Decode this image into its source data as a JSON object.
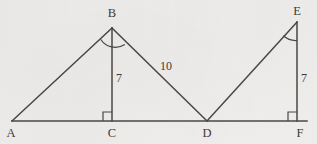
{
  "figure": {
    "kind": "geometry-diagram",
    "canvas": {
      "width": 317,
      "height": 144
    },
    "background_color": "#f1efed",
    "stroke_color": "#4a4745",
    "text_color": "#3f3c3a",
    "stroke_width": 1.5
  },
  "vertices": [
    {
      "id": "A",
      "label": "A",
      "x": 12,
      "y": 121,
      "label_x": 11,
      "label_y": 133
    },
    {
      "id": "B",
      "label": "B",
      "x": 112,
      "y": 28,
      "label_x": 112,
      "label_y": 13
    },
    {
      "id": "C",
      "label": "C",
      "x": 112,
      "y": 121,
      "label_x": 112,
      "label_y": 133
    },
    {
      "id": "D",
      "label": "D",
      "x": 207,
      "y": 121,
      "label_x": 207,
      "label_y": 133
    },
    {
      "id": "E",
      "label": "E",
      "x": 297,
      "y": 22,
      "label_x": 297,
      "label_y": 11
    },
    {
      "id": "F",
      "label": "F",
      "x": 297,
      "y": 121,
      "label_x": 300,
      "label_y": 133
    }
  ],
  "segments": [
    {
      "name": "baseline-A-F",
      "from": "A",
      "to": "F",
      "x1": 12,
      "y1": 121,
      "x2": 307,
      "y2": 121
    },
    {
      "name": "side-A-B",
      "from": "A",
      "to": "B",
      "x1": 12,
      "y1": 121,
      "x2": 112,
      "y2": 28
    },
    {
      "name": "altitude-B-C",
      "from": "B",
      "to": "C",
      "x1": 112,
      "y1": 28,
      "x2": 112,
      "y2": 121
    },
    {
      "name": "hypotenuse-B-D",
      "from": "B",
      "to": "D",
      "x1": 112,
      "y1": 28,
      "x2": 207,
      "y2": 121
    },
    {
      "name": "hypotenuse-D-E",
      "from": "D",
      "to": "E",
      "x1": 207,
      "y1": 121,
      "x2": 297,
      "y2": 22
    },
    {
      "name": "altitude-E-F",
      "from": "E",
      "to": "F",
      "x1": 297,
      "y1": 22,
      "x2": 297,
      "y2": 121
    }
  ],
  "measure_labels": [
    {
      "name": "length-b-c",
      "value": "7",
      "x": 119,
      "y": 78,
      "for_segment": "altitude-B-C"
    },
    {
      "name": "length-b-d",
      "value": "10",
      "x": 166,
      "y": 66,
      "for_segment": "hypotenuse-B-D"
    },
    {
      "name": "length-e-f",
      "value": "7",
      "x": 304,
      "y": 78,
      "for_segment": "altitude-E-F"
    }
  ],
  "right_angle_marks": [
    {
      "name": "right-angle-at-c",
      "at_vertex": "C",
      "x": 112,
      "y": 121,
      "size": 9,
      "opens": "up-left"
    },
    {
      "name": "right-angle-at-f",
      "at_vertex": "F",
      "x": 297,
      "y": 121,
      "size": 9,
      "opens": "up-left"
    }
  ],
  "angle_arcs": [
    {
      "name": "angle-arc-at-b",
      "at_vertex": "B",
      "spans": "A-B-D",
      "path": "M 100.5 40.5 A 17 17 0 0 0 124.5 45.0"
    },
    {
      "name": "angle-arc-at-e",
      "at_vertex": "E",
      "spans": "D-E-F",
      "path": "M 283.5 35.0 A 18 18 0 0 0 297 40.0"
    }
  ]
}
